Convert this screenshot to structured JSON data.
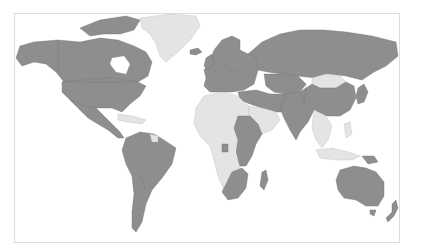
{
  "map": {
    "type": "choropleth",
    "projection": "world (Robinson-like, equirectangular approximation)",
    "colors": {
      "category_a": "#8e8e8e",
      "category_b": "#e4e4e4",
      "background": "#ffffff",
      "frame": "#dcdcdc"
    },
    "category_a_regions": [
      "Canada",
      "United States",
      "Mexico",
      "Central America",
      "Colombia",
      "Venezuela",
      "Brazil",
      "Peru",
      "Bolivia",
      "Chile",
      "Argentina",
      "Paraguay",
      "Ecuador",
      "Iceland",
      "Western Europe",
      "Northern Europe",
      "Eastern Europe",
      "Russia",
      "Kazakhstan",
      "Central Asia",
      "Iran",
      "Turkey",
      "Iraq",
      "China",
      "India",
      "Pakistan",
      "Afghanistan",
      "Japan",
      "Korea",
      "Sudan",
      "Ethiopia",
      "Kenya",
      "Tanzania",
      "Madagascar",
      "South Africa",
      "Mozambique",
      "Gabon",
      "Australia",
      "New Zealand",
      "Papua New Guinea"
    ],
    "category_b_regions": [
      "Greenland",
      "Mongolia",
      "Caribbean",
      "Guyana",
      "North Africa",
      "West Africa",
      "Central Africa",
      "Angola",
      "Namibia",
      "Botswana",
      "Arabian Peninsula",
      "Southeast Asia",
      "Indonesia",
      "Philippines"
    ]
  }
}
